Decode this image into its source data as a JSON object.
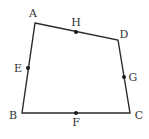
{
  "figure": {
    "type": "quadrilateral",
    "stroke_color": "#2a2a2a",
    "vertices": {
      "A": {
        "label": "A",
        "x": 35,
        "y": 23,
        "label_x": 33,
        "label_y": 14
      },
      "B": {
        "label": "B",
        "x": 22,
        "y": 113,
        "label_x": 13,
        "label_y": 116
      },
      "C": {
        "label": "C",
        "x": 130,
        "y": 113,
        "label_x": 139,
        "label_y": 116
      },
      "D": {
        "label": "D",
        "x": 118,
        "y": 40,
        "label_x": 124,
        "label_y": 35
      }
    },
    "midpoints": {
      "E": {
        "label": "E",
        "on_side": "AB",
        "x": 28,
        "y": 68,
        "label_x": 18,
        "label_y": 69
      },
      "F": {
        "label": "F",
        "on_side": "BC",
        "x": 76,
        "y": 113,
        "label_x": 76,
        "label_y": 123
      },
      "G": {
        "label": "G",
        "on_side": "CD",
        "x": 124,
        "y": 77,
        "label_x": 133,
        "label_y": 78
      },
      "H": {
        "label": "H",
        "on_side": "AD",
        "x": 76,
        "y": 32,
        "label_x": 76,
        "label_y": 23
      }
    }
  }
}
